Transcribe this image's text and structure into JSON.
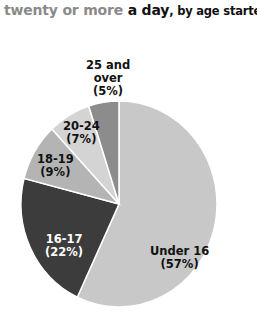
{
  "title": {
    "part1": "twenty or more",
    "part2": " a day",
    "part3": ", by age started"
  },
  "chart_data": {
    "type": "pie",
    "title": "twenty or more a day, by age started",
    "categories": [
      "Under 16",
      "16-17",
      "18-19",
      "20-24",
      "25 and over"
    ],
    "values": [
      57,
      22,
      9,
      7,
      5
    ],
    "unit": "%",
    "colors": [
      "#c8c8c8",
      "#3c3c3c",
      "#b4b4b4",
      "#d4d4d4",
      "#8c8c8c"
    ],
    "start_angle_deg": 0,
    "direction": "clockwise"
  },
  "labels": [
    {
      "name": "Under 16",
      "pct": "(57%)"
    },
    {
      "name": "16-17",
      "pct": "(22%)"
    },
    {
      "name": "18-19",
      "pct": "(9%)"
    },
    {
      "name": "20-24",
      "pct": "(7%)"
    },
    {
      "name": "25 and",
      "name2": "over",
      "pct": "(5%)"
    }
  ]
}
